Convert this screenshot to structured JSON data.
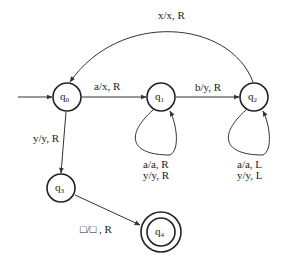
{
  "diagram": {
    "type": "turing-machine-state-diagram",
    "states": [
      {
        "id": "q0",
        "base": "q",
        "sub": "0",
        "initial": true,
        "final": false
      },
      {
        "id": "q1",
        "base": "q",
        "sub": "1",
        "initial": false,
        "final": false
      },
      {
        "id": "q2",
        "base": "q",
        "sub": "2",
        "initial": false,
        "final": false
      },
      {
        "id": "q3",
        "base": "q",
        "sub": "3",
        "initial": false,
        "final": false
      },
      {
        "id": "q4",
        "base": "q",
        "sub": "4",
        "initial": false,
        "final": true
      }
    ],
    "transitions": [
      {
        "from": "q0",
        "to": "q1",
        "label": "a/x, R"
      },
      {
        "from": "q1",
        "to": "q2",
        "label": "b/y, R"
      },
      {
        "from": "q2",
        "to": "q0",
        "label": "x/x, R"
      },
      {
        "from": "q0",
        "to": "q3",
        "label": "y/y, R"
      },
      {
        "from": "q3",
        "to": "q4",
        "label": "□/□ , R"
      },
      {
        "from": "q1",
        "to": "q1",
        "label_lines": [
          "a/a, R",
          "y/y, R"
        ]
      },
      {
        "from": "q2",
        "to": "q2",
        "label_lines": [
          "a/a, L",
          "y/y, L"
        ]
      }
    ]
  }
}
